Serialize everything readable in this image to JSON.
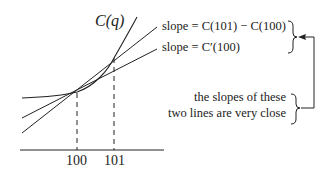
{
  "diagram": {
    "curve_label": "C(q)",
    "secant_label": "slope = C(101) − C(100)",
    "tangent_label": "slope = C′(100)",
    "annotation": {
      "line1": "the slopes of these",
      "line2": "two lines are very close"
    },
    "x_ticks": [
      "100",
      "101"
    ],
    "colors": {
      "ink": "#222222",
      "background": "#ffffff"
    }
  }
}
